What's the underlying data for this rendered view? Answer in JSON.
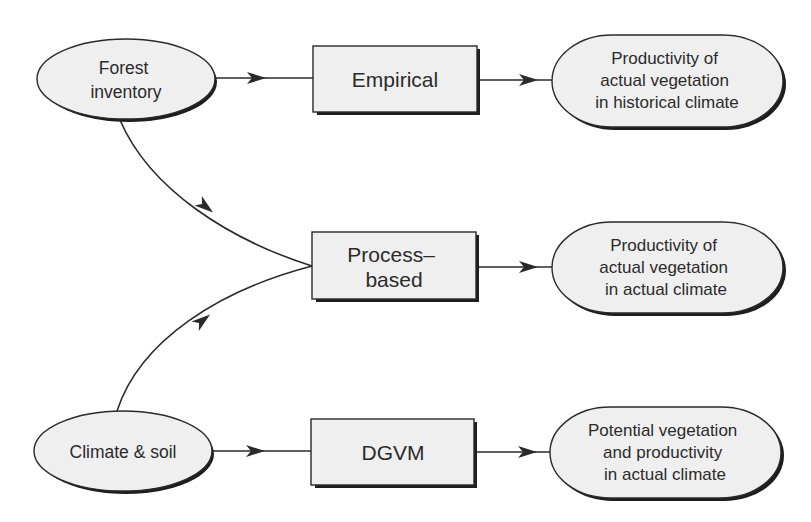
{
  "diagram": {
    "inputs": {
      "forest_inventory": {
        "lines": [
          "Forest",
          "inventory"
        ]
      },
      "climate_soil": {
        "lines": [
          "Climate & soil"
        ]
      }
    },
    "models": {
      "empirical": {
        "lines": [
          "Empirical"
        ]
      },
      "process_based": {
        "lines": [
          "Process–",
          "based"
        ]
      },
      "dgvm": {
        "lines": [
          "DGVM"
        ]
      }
    },
    "outputs": {
      "historical": {
        "lines": [
          "Productivity of",
          "actual vegetation",
          "in historical climate"
        ]
      },
      "actual": {
        "lines": [
          "Productivity of",
          "actual vegetation",
          "in actual climate"
        ]
      },
      "potential": {
        "lines": [
          "Potential vegetation",
          "and productivity",
          "in actual climate"
        ]
      }
    },
    "edges": [
      {
        "from": "Forest inventory",
        "to": "Empirical"
      },
      {
        "from": "Empirical",
        "to": "Productivity of actual vegetation in historical climate"
      },
      {
        "from": "Forest inventory",
        "to": "Process-based"
      },
      {
        "from": "Climate & soil",
        "to": "Process-based"
      },
      {
        "from": "Process-based",
        "to": "Productivity of actual vegetation in actual climate"
      },
      {
        "from": "Climate & soil",
        "to": "DGVM"
      },
      {
        "from": "DGVM",
        "to": "Potential vegetation and productivity in actual climate"
      }
    ],
    "colors": {
      "node_fill": "#efefef",
      "stroke": "#2a2a2a",
      "shadow": "#1e1e1e",
      "background": "#ffffff"
    }
  }
}
